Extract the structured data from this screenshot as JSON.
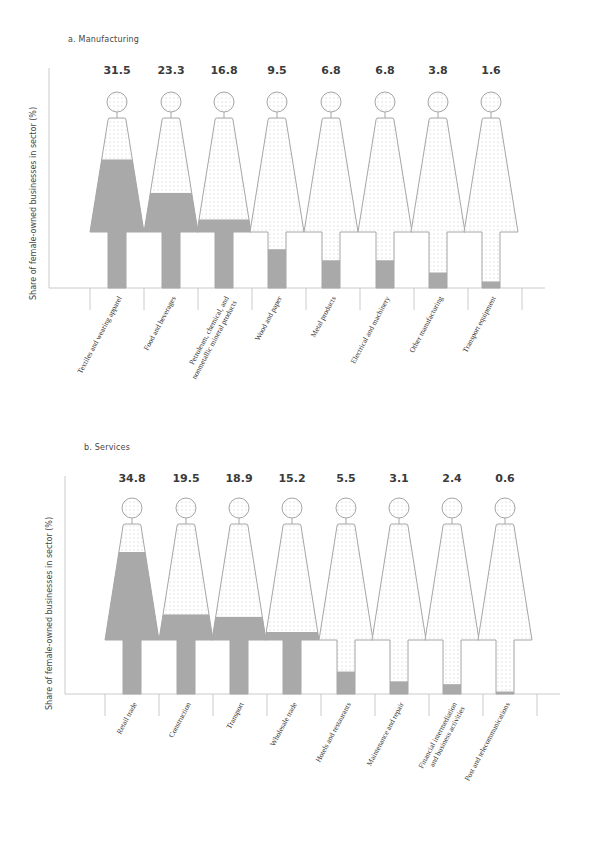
{
  "chart_data": [
    {
      "type": "bar",
      "style": "pictogram (female figures, shaded fill proportional to share)",
      "title": "a. Manufacturing",
      "ylabel": "Share of female-owned businesses in sector (%)",
      "xlabel": "",
      "ylim": [
        0,
        100
      ],
      "grid": false,
      "legend": null,
      "categories": [
        "Textiles and wearing apparel",
        "Food and beverages",
        "Petroleum, chemical, and nonmetallic mineral products",
        "Wood and paper",
        "Metal products",
        "Electrical and machinery",
        "Other manufacturing",
        "Transport equipment"
      ],
      "values": [
        31.5,
        23.3,
        16.8,
        9.5,
        6.8,
        6.8,
        3.8,
        1.6
      ],
      "value_labels": [
        "31.5",
        "23.3",
        "16.8",
        "9.5",
        "6.8",
        "6.8",
        "3.8",
        "1.6"
      ]
    },
    {
      "type": "bar",
      "style": "pictogram (female figures, shaded fill proportional to share)",
      "title": "b. Services",
      "ylabel": "Share of female-owned businesses in sector (%)",
      "xlabel": "",
      "ylim": [
        0,
        100
      ],
      "grid": false,
      "legend": null,
      "categories": [
        "Retail trade",
        "Construction",
        "Transport",
        "Wholesale trade",
        "Hotels and restaurants",
        "Maintenance and repair",
        "Financial intermediation and business activities",
        "Post and telecommunications"
      ],
      "values": [
        34.8,
        19.5,
        18.9,
        15.2,
        5.5,
        3.1,
        2.4,
        0.6
      ],
      "value_labels": [
        "34.8",
        "19.5",
        "18.9",
        "15.2",
        "5.5",
        "3.1",
        "2.4",
        "0.6"
      ]
    }
  ],
  "colors": {
    "fill": "#a9a9a9",
    "outline": "#a6a6a6",
    "dots": "#9a9a9a",
    "axis": "#bdbdbd",
    "text": "#333333"
  },
  "panels": {
    "manufacturing": {
      "title": "a. Manufacturing",
      "ylabel": "Share of female-owned businesses in sector (%)"
    },
    "services": {
      "title": "b. Services",
      "ylabel": "Share of female-owned businesses in sector (%)"
    }
  }
}
